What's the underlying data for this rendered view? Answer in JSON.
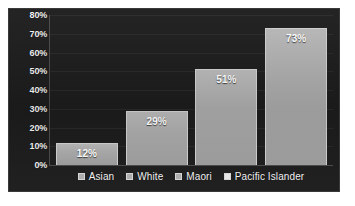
{
  "figure": {
    "background_color": "#1c1c1c",
    "page_background_color": "#ffffff",
    "border_color": "#3a3a3a",
    "bar_color": "#aeaeae",
    "bar_border_color": "#cfcfcf",
    "text_color": "#f2f2f2",
    "gridline_color": "#2e2e2e"
  },
  "chart_data": {
    "type": "bar",
    "title": "",
    "subtitle": "",
    "xlabel": "",
    "ylabel": "",
    "categories": [
      "Asian",
      "White",
      "Maori",
      "Pacific Islander"
    ],
    "values": [
      12,
      29,
      51,
      73
    ],
    "value_labels": [
      "12%",
      "29%",
      "51%",
      "73%"
    ],
    "ylim": [
      0,
      80
    ],
    "ytick_values": [
      0,
      10,
      20,
      30,
      40,
      50,
      60,
      70,
      80
    ],
    "ytick_labels": [
      "0%",
      "10%",
      "20%",
      "30%",
      "40%",
      "50%",
      "60%",
      "70%",
      "80%"
    ],
    "grid": true,
    "grid_axis": "y",
    "legend_position": "bottom",
    "legend_entries": [
      {
        "label": "Asian",
        "swatch": "legend-swatch-square",
        "color": "#aeaeae"
      },
      {
        "label": "White",
        "swatch": "legend-swatch-square",
        "color": "#aeaeae"
      },
      {
        "label": "Maori",
        "swatch": "legend-swatch-square",
        "color": "#aeaeae"
      },
      {
        "label": "Pacific Islander",
        "swatch": "legend-swatch-square",
        "color": "#e9e9e9"
      }
    ],
    "data_labels_inside_bars": true
  }
}
